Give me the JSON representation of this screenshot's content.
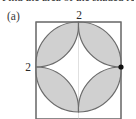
{
  "problem": {
    "statement_fragment": "Find the area of the shaded region.",
    "part_label": "(a)"
  },
  "figure": {
    "name": "quatrefoil-in-square",
    "top_dimension": "2",
    "left_dimension": "2",
    "square": {
      "x": 36,
      "y": 22,
      "width": 85,
      "height": 97,
      "stroke": "#6e6e6e",
      "stroke_width": 1.1,
      "fill": "#ffffff"
    },
    "petals": {
      "count": 4,
      "fill": "#d0d0d0",
      "stroke": "#6b6b6b",
      "stroke_width": 1.2,
      "center_x": 78.5,
      "center_y": 67,
      "radius": 42.5
    },
    "marker_dot": {
      "cx": 121,
      "cy": 67,
      "r": 2.6,
      "color": "#111111"
    },
    "inner_guide": {
      "stroke": "#d8d8d8",
      "stroke_width": 0.9
    }
  }
}
